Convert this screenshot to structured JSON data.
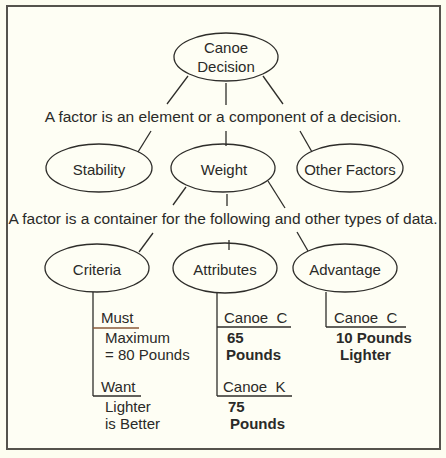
{
  "diagram": {
    "root": {
      "label_line1": "Canoe",
      "label_line2": "Decision"
    },
    "caption_factor_element": "A factor is an element or a component of a decision.",
    "factors": [
      {
        "label": "Stability"
      },
      {
        "label": "Weight"
      },
      {
        "label": "Other Factors"
      }
    ],
    "caption_factor_container": "A factor is a container for the following and other types of data.",
    "data_types": [
      {
        "label": "Criteria"
      },
      {
        "label": "Attributes"
      },
      {
        "label": "Advantage"
      }
    ],
    "criteria": {
      "must": {
        "heading": "Must",
        "line1": "Maximum",
        "line2": "= 80 Pounds"
      },
      "want": {
        "heading": "Want",
        "line1": "Lighter",
        "line2": "is Better"
      }
    },
    "attributes": {
      "canoe_c": {
        "heading": "Canoe  C",
        "line1": "65",
        "line2": "Pounds"
      },
      "canoe_k": {
        "heading": "Canoe  K",
        "line1": "75",
        "line2": "Pounds"
      }
    },
    "advantage": {
      "canoe_c": {
        "heading": "Canoe  C",
        "line1": "10 Pounds",
        "line2": "Lighter"
      }
    }
  },
  "colors": {
    "background": "#fefef4",
    "stroke": "#2e2d2a",
    "frame": "#55534c",
    "underline_accent": "#8a5a3a"
  }
}
